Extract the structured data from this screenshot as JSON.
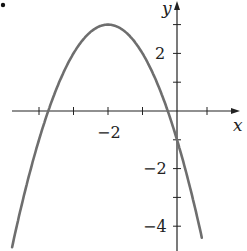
{
  "chart_data": {
    "type": "line",
    "title": "",
    "xlabel": "x",
    "ylabel": "y",
    "function": "y = -(x + 2)^2 + 3",
    "vertex": [
      -2,
      3
    ],
    "y_intercept": [
      0,
      -1
    ],
    "x_intercepts": [
      -3.73,
      -0.27
    ],
    "xlim": [
      -5.1,
      2.0
    ],
    "ylim": [
      -4.9,
      3.8
    ],
    "x_ticks": [
      -4,
      -3,
      -2,
      -1,
      1
    ],
    "x_tick_labels": [
      {
        "value": -2,
        "label": "−2"
      }
    ],
    "y_ticks": [
      -4,
      -3,
      -2,
      -1,
      1,
      2,
      3
    ],
    "y_tick_labels": [
      {
        "value": 2,
        "label": "2"
      },
      {
        "value": -2,
        "label": "−2"
      },
      {
        "value": -4,
        "label": "−4"
      }
    ],
    "grid": false,
    "legend": null,
    "series": [
      {
        "name": "parabola",
        "color": "#6e6e6e",
        "x": [
          -5,
          -4.5,
          -4,
          -3.5,
          -3,
          -2.5,
          -2,
          -1.5,
          -1,
          -0.5,
          0,
          0.5,
          0.75
        ],
        "y": [
          -6,
          -3.25,
          -1,
          0.75,
          2,
          2.75,
          3,
          2.75,
          2,
          0.75,
          -1,
          -3.25,
          -4.56
        ]
      }
    ]
  },
  "labels": {
    "x_axis": "x",
    "y_axis": "y",
    "tick_minus2_x": "−2",
    "tick_2_y": "2",
    "tick_minus2_y": "−2",
    "tick_minus4_y": "−4"
  },
  "colors": {
    "axis": "#222222",
    "curve": "#6e6e6e",
    "bullet": "#111111"
  }
}
